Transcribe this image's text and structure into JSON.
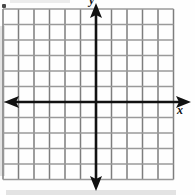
{
  "figure": {
    "kind": "coordinate-grid",
    "width": 195,
    "height": 195,
    "background_color": "#fefefe"
  },
  "labels": {
    "x_axis": "x",
    "y_axis": "y"
  },
  "chart_data": {
    "type": "scatter",
    "title": "",
    "xlabel": "x",
    "ylabel": "y",
    "grid": true,
    "legend": null,
    "series": [],
    "x": [],
    "values": [],
    "xlim": [
      -6,
      5
    ],
    "ylim": [
      -5,
      6
    ],
    "x_tick_labels": [],
    "y_tick_labels": [],
    "gridlines": {
      "vertical_count": 12,
      "horizontal_count": 12,
      "spacing_px": 15.5,
      "color": "#7d7d7d"
    },
    "axes": {
      "color": "#111111",
      "x_axis_y_px": 102,
      "y_axis_x_px": 96,
      "arrowheads": [
        "left",
        "right",
        "up",
        "down"
      ]
    },
    "annotations": []
  },
  "colors": {
    "grid_line": "#7d7d7d",
    "grid_line_light": "#9a9a9a",
    "axis": "#111111",
    "label_text": "#141414",
    "background": "#fefefe",
    "artifact": "#2a2a2a"
  },
  "icons": {
    "arrow_right": "arrow-right-icon",
    "arrow_left": "arrow-left-icon",
    "arrow_up": "arrow-up-icon",
    "arrow_down": "arrow-down-icon"
  }
}
